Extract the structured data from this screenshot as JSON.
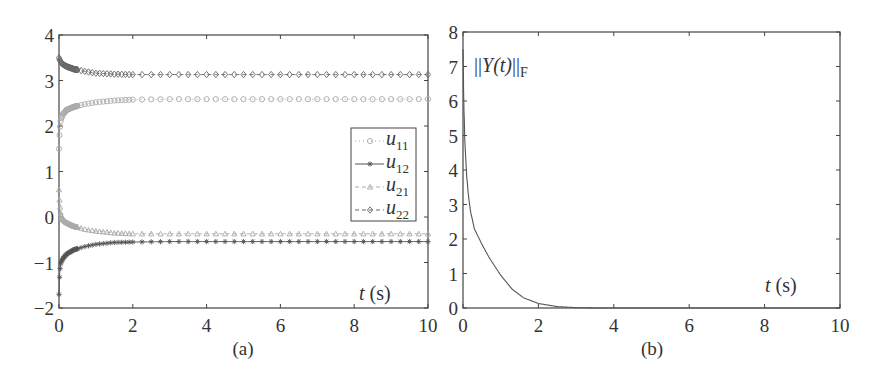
{
  "chart_data": [
    {
      "type": "line",
      "caption": "(a)",
      "xlabel": "t (s)",
      "ylabel": "",
      "xlim": [
        0,
        10
      ],
      "ylim": [
        -2,
        4
      ],
      "xticks": [
        "0",
        "2",
        "4",
        "6",
        "8",
        "10"
      ],
      "yticks": [
        "4",
        "3",
        "2",
        "1",
        "0",
        "-1",
        "-2"
      ],
      "grid": false,
      "legend_position": "right-center",
      "series": [
        {
          "name": "u11",
          "sub": "11",
          "marker": "circle",
          "line": "dotted",
          "color": "#aaaaaa",
          "x": [
            0,
            0.02,
            0.05,
            0.1,
            0.2,
            0.4,
            0.7,
            1.0,
            1.5,
            2,
            3,
            4,
            6,
            8,
            10
          ],
          "y": [
            1.5,
            1.9,
            2.15,
            2.25,
            2.35,
            2.42,
            2.48,
            2.52,
            2.56,
            2.58,
            2.59,
            2.59,
            2.59,
            2.59,
            2.59
          ]
        },
        {
          "name": "u12",
          "sub": "12",
          "marker": "asterisk",
          "line": "solid",
          "color": "#555555",
          "x": [
            0,
            0.02,
            0.05,
            0.1,
            0.2,
            0.4,
            0.7,
            1.0,
            1.5,
            2,
            3,
            4,
            6,
            8,
            10
          ],
          "y": [
            -1.7,
            -1.2,
            -1.0,
            -0.92,
            -0.82,
            -0.72,
            -0.65,
            -0.6,
            -0.56,
            -0.55,
            -0.54,
            -0.54,
            -0.54,
            -0.54,
            -0.54
          ]
        },
        {
          "name": "u21",
          "sub": "21",
          "marker": "triangle",
          "line": "dashed",
          "color": "#aaaaaa",
          "x": [
            0,
            0.02,
            0.05,
            0.1,
            0.2,
            0.4,
            0.7,
            1.0,
            1.5,
            2,
            3,
            4,
            6,
            8,
            10
          ],
          "y": [
            0.6,
            0.3,
            0.05,
            -0.05,
            -0.12,
            -0.2,
            -0.27,
            -0.31,
            -0.35,
            -0.37,
            -0.37,
            -0.37,
            -0.37,
            -0.37,
            -0.37
          ]
        },
        {
          "name": "u22",
          "sub": "22",
          "marker": "diamond",
          "line": "dashed",
          "color": "#666666",
          "x": [
            0,
            0.02,
            0.05,
            0.1,
            0.2,
            0.4,
            0.7,
            1.0,
            1.5,
            2,
            3,
            4,
            6,
            8,
            10
          ],
          "y": [
            3.5,
            3.45,
            3.4,
            3.36,
            3.31,
            3.25,
            3.2,
            3.16,
            3.14,
            3.13,
            3.13,
            3.13,
            3.13,
            3.13,
            3.13
          ]
        }
      ]
    },
    {
      "type": "line",
      "caption": "(b)",
      "xlabel": "t (s)",
      "ylabel": "",
      "annotation": "||Y(t)||F",
      "xlim": [
        0,
        10
      ],
      "ylim": [
        0,
        8
      ],
      "xticks": [
        "0",
        "2",
        "4",
        "6",
        "8",
        "10"
      ],
      "yticks": [
        "8",
        "7",
        "6",
        "5",
        "4",
        "3",
        "2",
        "1",
        "0"
      ],
      "grid": false,
      "series": [
        {
          "name": "||Y(t)||F",
          "color": "#555555",
          "x": [
            0,
            0.02,
            0.05,
            0.1,
            0.15,
            0.2,
            0.3,
            0.5,
            0.7,
            1.0,
            1.3,
            1.6,
            2.0,
            2.5,
            3.0,
            3.5,
            4,
            6,
            8,
            10
          ],
          "y": [
            7.5,
            6.0,
            4.8,
            3.8,
            3.2,
            2.8,
            2.3,
            1.85,
            1.45,
            0.95,
            0.55,
            0.3,
            0.13,
            0.04,
            0.01,
            0.0,
            0,
            0,
            0,
            0
          ]
        }
      ]
    }
  ],
  "labels": {
    "a": {
      "caption": "(a)",
      "t": "t",
      "s": " (s)",
      "legend_u": "u"
    },
    "b": {
      "caption": "(b)",
      "t": "t",
      "s": " (s)",
      "norm_open": "||",
      "norm_Y": "Y(t)",
      "norm_close": "||",
      "norm_sub": "F"
    }
  }
}
